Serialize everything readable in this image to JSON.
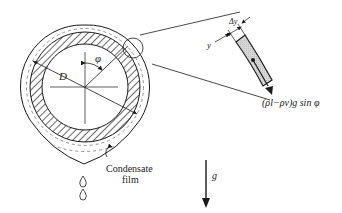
{
  "figure": {
    "type": "condensation on horizontal tube",
    "labels": {
      "diameter": "D",
      "angle": "φ",
      "film": "Condensate",
      "film2": "film",
      "gravity": "g",
      "y": "y",
      "dy": "Δy",
      "force": "(ρl−ρv)g sin φ"
    },
    "colors": {
      "ink": "#1a1a1a",
      "element_fill": "#d6d6d6",
      "background": "#ffffff"
    }
  }
}
